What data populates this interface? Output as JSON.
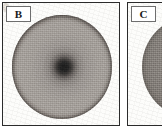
{
  "figure": {
    "kind": "micrograph-panel-pair",
    "background_color": "#ffffff",
    "border_color": "#2b2b2b",
    "panels": [
      {
        "id": "B",
        "label": "B",
        "label_box_border_color": "#6e6e6e",
        "label_box_fill": "#ffffff",
        "subject": "circular colony / culture dish viewed from above",
        "disc": {
          "fill_outer": "#a39e99",
          "fill_rim": "#59524d",
          "fill_center": "#1b1b1b",
          "highlight_color": "#f2efe9",
          "has_dark_center": true,
          "has_specular_highlight": true,
          "cropped": false
        }
      },
      {
        "id": "C",
        "label": "C",
        "label_box_border_color": "#6e6e6e",
        "label_box_fill": "#ffffff",
        "subject": "circular colony / culture dish, cropped at the right edge of the figure",
        "disc": {
          "fill_outer": "#8a8580",
          "fill_rim": "#514b47",
          "fill_center": "#8f8a86",
          "has_dark_center": false,
          "has_specular_highlight": false,
          "cropped": true
        }
      }
    ]
  }
}
